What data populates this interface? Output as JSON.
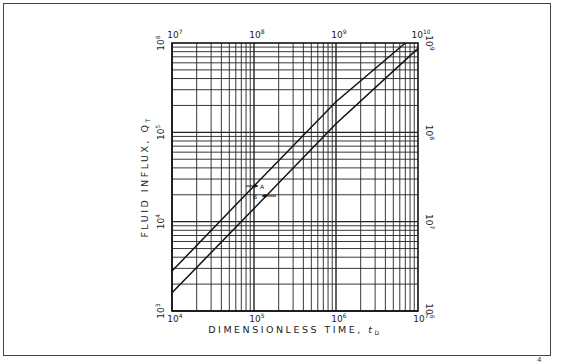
{
  "chart_data": {
    "type": "line",
    "title": "",
    "xlabel": "DIMENSIONLESS TIME, tD",
    "ylabel": "FLUID INFLUX, QT",
    "x_scale": "log",
    "y_scale": "log",
    "xlim": [
      10000,
      10000000
    ],
    "ylim": [
      1000,
      1000000
    ],
    "x_ticks_bottom": [
      "10^4",
      "10^5",
      "10^6",
      "10^7"
    ],
    "x_ticks_top": [
      "10^7",
      "10^8",
      "10^9",
      "10^10"
    ],
    "y_ticks_left": [
      "10^3",
      "10^4",
      "10^5",
      "10^6"
    ],
    "y_ticks_right": [
      "10^6",
      "10^7",
      "10^8",
      "10^9"
    ],
    "grid": true,
    "annotations": [
      {
        "text": "A",
        "note": "arrow pointing to upper curve (read with top/right scales)"
      },
      {
        "text": "B",
        "note": "arrow pointing to lower curve (read with bottom/left scales)"
      }
    ],
    "series": [
      {
        "name": "A",
        "x": [
          10000,
          100000,
          1000000,
          7000000
        ],
        "y": [
          2800,
          25000,
          220000,
          1000000
        ]
      },
      {
        "name": "B",
        "x": [
          10000,
          100000,
          1000000,
          10000000
        ],
        "y": [
          1600,
          14000,
          125000,
          870000
        ]
      }
    ]
  },
  "labels": {
    "x_title_main": "DIMENSIONLESS TIME, ",
    "x_title_sym": "t",
    "x_title_sub": "D",
    "y_title_main": "FLUID   INFLUX, ",
    "y_title_sym": "Q",
    "y_title_sub": "T",
    "bottom": [
      {
        "b": "10",
        "e": "4"
      },
      {
        "b": "10",
        "e": "5"
      },
      {
        "b": "10",
        "e": "6"
      },
      {
        "b": "10",
        "e": "7"
      }
    ],
    "top": [
      {
        "b": "10",
        "e": "7"
      },
      {
        "b": "10",
        "e": "8"
      },
      {
        "b": "10",
        "e": "9"
      },
      {
        "b": "10",
        "e": "10"
      }
    ],
    "left": [
      {
        "b": "10",
        "e": "3"
      },
      {
        "b": "10",
        "e": "4"
      },
      {
        "b": "10",
        "e": "5"
      },
      {
        "b": "10",
        "e": "6"
      }
    ],
    "right": [
      {
        "b": "10",
        "e": "6"
      },
      {
        "b": "10",
        "e": "7"
      },
      {
        "b": "10",
        "e": "8"
      },
      {
        "b": "10",
        "e": "9"
      }
    ],
    "annot_a": "A",
    "annot_b": "B",
    "corner_mark": "4"
  }
}
